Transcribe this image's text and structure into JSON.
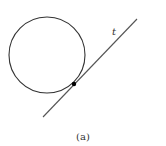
{
  "figure": {
    "caption": "(a)",
    "line_label": "t",
    "circle": {
      "cx": 47,
      "cy": 55,
      "r": 38
    },
    "line": {
      "x1": 43,
      "y1": 117,
      "x2": 137,
      "y2": 19
    },
    "tangent_point": {
      "x": 74,
      "y": 84
    },
    "colors": {
      "circle": "#333333",
      "line": "#555555",
      "point": "#000000"
    }
  }
}
